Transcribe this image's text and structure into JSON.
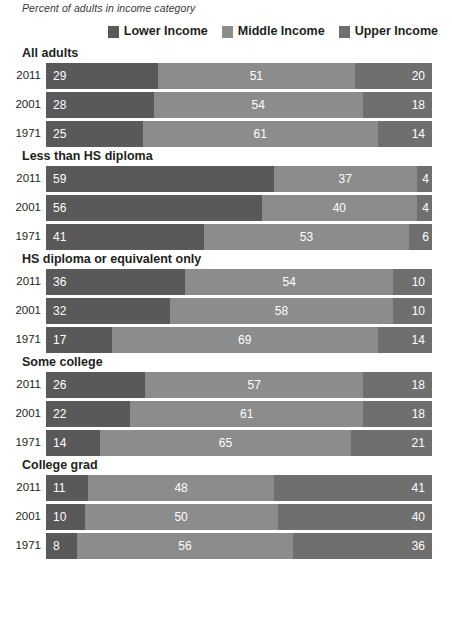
{
  "subtitle": "Percent of adults in income category",
  "legend": {
    "items": [
      {
        "label": "Lower Income",
        "color": "#595959",
        "key": "lower"
      },
      {
        "label": "Middle Income",
        "color": "#8c8c8c",
        "key": "middle"
      },
      {
        "label": "Upper Income",
        "color": "#6f6f6f",
        "key": "upper"
      }
    ]
  },
  "chart_data": {
    "type": "bar",
    "title": "",
    "subtitle": "Percent of adults in income category",
    "orientation": "horizontal",
    "stacked": true,
    "stack_total": 100,
    "xlabel": "",
    "ylabel": "",
    "xlim": [
      0,
      100
    ],
    "grid": false,
    "legend_position": "top-right",
    "series": [
      {
        "name": "Lower Income",
        "color": "#595959"
      },
      {
        "name": "Middle Income",
        "color": "#8c8c8c"
      },
      {
        "name": "Upper Income",
        "color": "#6f6f6f"
      }
    ],
    "groups": [
      {
        "name": "All adults",
        "rows": [
          {
            "year": "2011",
            "lower": 29,
            "middle": 51,
            "upper": 20
          },
          {
            "year": "2001",
            "lower": 28,
            "middle": 54,
            "upper": 18
          },
          {
            "year": "1971",
            "lower": 25,
            "middle": 61,
            "upper": 14
          }
        ]
      },
      {
        "name": "Less than HS diploma",
        "rows": [
          {
            "year": "2011",
            "lower": 59,
            "middle": 37,
            "upper": 4
          },
          {
            "year": "2001",
            "lower": 56,
            "middle": 40,
            "upper": 4
          },
          {
            "year": "1971",
            "lower": 41,
            "middle": 53,
            "upper": 6
          }
        ]
      },
      {
        "name": "HS diploma or equivalent only",
        "rows": [
          {
            "year": "2011",
            "lower": 36,
            "middle": 54,
            "upper": 10
          },
          {
            "year": "2001",
            "lower": 32,
            "middle": 58,
            "upper": 10
          },
          {
            "year": "1971",
            "lower": 17,
            "middle": 69,
            "upper": 14
          }
        ]
      },
      {
        "name": "Some college",
        "rows": [
          {
            "year": "2011",
            "lower": 26,
            "middle": 57,
            "upper": 18
          },
          {
            "year": "2001",
            "lower": 22,
            "middle": 61,
            "upper": 18
          },
          {
            "year": "1971",
            "lower": 14,
            "middle": 65,
            "upper": 21
          }
        ]
      },
      {
        "name": "College grad",
        "rows": [
          {
            "year": "2011",
            "lower": 11,
            "middle": 48,
            "upper": 41
          },
          {
            "year": "2001",
            "lower": 10,
            "middle": 50,
            "upper": 40
          },
          {
            "year": "1971",
            "lower": 8,
            "middle": 56,
            "upper": 36
          }
        ]
      }
    ]
  }
}
